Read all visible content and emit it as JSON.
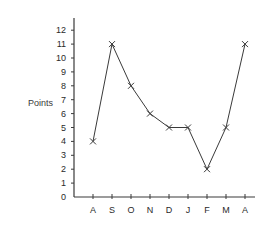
{
  "chart_data": {
    "type": "line",
    "title": "",
    "xlabel": "",
    "ylabel": "Points",
    "categories": [
      "A",
      "S",
      "O",
      "N",
      "D",
      "J",
      "F",
      "M",
      "A"
    ],
    "values": [
      4,
      11,
      8,
      6,
      5,
      5,
      2,
      5,
      11
    ],
    "yticks": [
      0,
      1,
      2,
      3,
      4,
      5,
      6,
      7,
      8,
      9,
      10,
      11,
      12
    ],
    "ylim": [
      0,
      12
    ],
    "grid": false,
    "legend": null,
    "marker": "x",
    "line_color": "#3a3a3a"
  }
}
